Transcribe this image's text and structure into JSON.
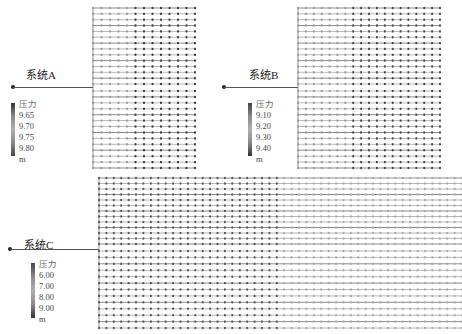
{
  "figure": {
    "type": "pipe-network-pressure-distribution",
    "systems": [
      {
        "id": "A",
        "label": "系统A",
        "legend": {
          "title": "压力",
          "ticks": [
            "9.65",
            "9.70",
            "9.75",
            "9.80"
          ],
          "unit": "m",
          "colors": [
            "#333333",
            "#8a8a8a",
            "#b0b0b0",
            "#8a8a8a",
            "#444444"
          ]
        },
        "grid": {
          "x": 93,
          "y": 8,
          "w": 102,
          "h": 160,
          "cols": 13,
          "rows": 28,
          "gap_y": 87
        }
      },
      {
        "id": "B",
        "label": "系统B",
        "legend": {
          "title": "压力",
          "ticks": [
            "9.10",
            "9.20",
            "9.30",
            "9.40"
          ],
          "unit": "m",
          "colors": [
            "#444444",
            "#8a8a8a",
            "#b0b0b0",
            "#8a8a8a",
            "#333333"
          ]
        },
        "grid": {
          "x": 298,
          "y": 8,
          "w": 142,
          "h": 160,
          "cols": 19,
          "rows": 28,
          "gap_y": 87
        }
      },
      {
        "id": "C",
        "label": "系统C",
        "legend": {
          "title": "压力",
          "ticks": [
            "6.00",
            "7.00",
            "8.00",
            "9.00"
          ],
          "unit": "m",
          "colors": [
            "#444444",
            "#8a8a8a",
            "#b0b0b0",
            "#8a8a8a",
            "#333333"
          ]
        },
        "grid": {
          "x": 99,
          "y": 178,
          "w": 363,
          "h": 150,
          "cols": 50,
          "rows": 26,
          "gap_y": 247
        }
      }
    ],
    "caption": ""
  }
}
